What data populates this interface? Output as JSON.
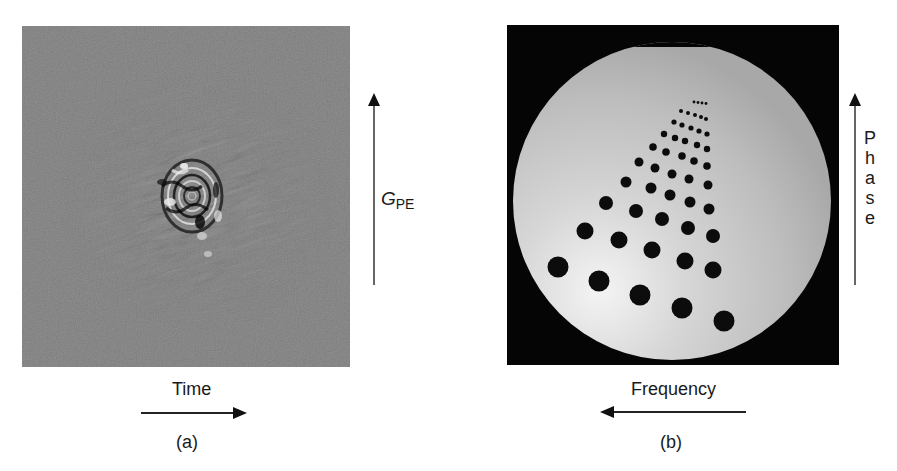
{
  "figure": {
    "panels": [
      {
        "id": "a",
        "caption": "(a)",
        "image_description": "k-space raw data (noisy gray field with bright central interference pattern)",
        "horizontal_axis": {
          "label": "Time",
          "arrow_direction": "right"
        },
        "vertical_axis": {
          "label_main": "G",
          "label_sub": "PE",
          "arrow_direction": "up"
        }
      },
      {
        "id": "b",
        "caption": "(b)",
        "image_description": "Reconstructed MR image of circular phantom with triangular array of dark holes of decreasing size",
        "horizontal_axis": {
          "label": "Frequency",
          "arrow_direction": "left"
        },
        "vertical_axis": {
          "label": "Phase",
          "letters": [
            "P",
            "h",
            "a",
            "s",
            "e"
          ],
          "arrow_direction": "up"
        }
      }
    ]
  },
  "colors": {
    "background": "#ffffff",
    "kspace_gray": "#7a7a7a",
    "phantom_bg": "#050505",
    "phantom_disc": "#c8c8c8",
    "text": "#1a1a1a"
  }
}
